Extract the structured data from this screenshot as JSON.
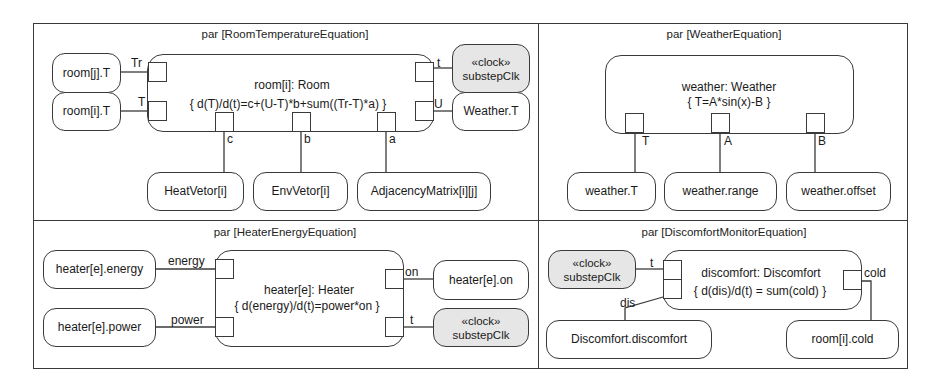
{
  "panels": {
    "room": {
      "title": "par [RoomTemperatureEquation]",
      "block": {
        "name": "room[i]: Room",
        "equation": "{ d(T)/d(t)=c+(U-T)*b+sum((Tr-T)*a) }"
      },
      "ports": {
        "tr": "Tr",
        "t_left": "T",
        "c": "c",
        "b": "b",
        "a": "a",
        "t_clock": "t",
        "u": "U"
      },
      "nodes": {
        "room_j_t": "room[j].T",
        "room_i_t": "room[i].T",
        "clock_stereotype": "«clock»",
        "clock_name": "substepClk",
        "weather_t": "Weather.T",
        "heat_vetor": "HeatVetor[i]",
        "env_vetor": "EnvVetor[i]",
        "adjacency": "AdjacencyMatrix[i][j]"
      }
    },
    "weather": {
      "title": "par [WeatherEquation]",
      "block": {
        "name": "weather: Weather",
        "equation": "{ T=A*sin(x)-B }"
      },
      "ports": {
        "t": "T",
        "a": "A",
        "b": "B"
      },
      "nodes": {
        "weather_t": "weather.T",
        "weather_range": "weather.range",
        "weather_offset": "weather.offset"
      }
    },
    "heater": {
      "title": "par [HeaterEnergyEquation]",
      "block": {
        "name": "heater[e]: Heater",
        "equation": "{ d(energy)/d(t)=power*on }"
      },
      "ports": {
        "energy": "energy",
        "power": "power",
        "on": "on",
        "t": "t"
      },
      "nodes": {
        "heater_energy": "heater[e].energy",
        "heater_power": "heater[e].power",
        "heater_on": "heater[e].on",
        "clock_stereotype": "«clock»",
        "clock_name": "substepClk"
      }
    },
    "discomfort": {
      "title": "par [DiscomfortMonitorEquation]",
      "block": {
        "name": "discomfort: Discomfort",
        "equation": "{ d(dis)/d(t) = sum(cold) }"
      },
      "ports": {
        "t": "t",
        "dis": "dis",
        "cold": "cold"
      },
      "nodes": {
        "clock_stereotype": "«clock»",
        "clock_name": "substepClk",
        "discomfort_discomfort": "Discomfort.discomfort",
        "room_cold": "room[i].cold"
      }
    }
  },
  "colors": {
    "line": "#3a3a3a",
    "clock_fill": "#e6e6e6",
    "background": "#ffffff"
  }
}
